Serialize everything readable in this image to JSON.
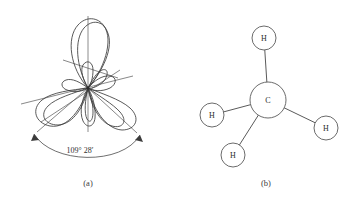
{
  "page": {
    "background_color": "#ffffff",
    "width": 356,
    "height": 202,
    "ink_color": "#4a4a4a",
    "text_color": "#2b2b2b"
  },
  "figure_a": {
    "caption": "(a)",
    "description": "sp3 hybrid orbital lobes radiating from a common center",
    "angle_label": "109° 28′",
    "angle_degrees": 109,
    "angle_minutes": 28,
    "center": {
      "x": 88,
      "y": 88
    },
    "lobes": [
      {
        "name": "lobe-up",
        "direction_deg": 90,
        "size": "large"
      },
      {
        "name": "lobe-down-left",
        "direction_deg": 215,
        "size": "large"
      },
      {
        "name": "lobe-down-right",
        "direction_deg": 325,
        "size": "large"
      },
      {
        "name": "lobe-down",
        "direction_deg": 270,
        "size": "medium"
      },
      {
        "name": "back-lobe-left",
        "direction_deg": 160,
        "size": "small"
      },
      {
        "name": "back-lobe-right",
        "direction_deg": 35,
        "size": "small"
      },
      {
        "name": "back-lobe-up-small",
        "direction_deg": 115,
        "size": "small"
      }
    ],
    "axes": [
      {
        "name": "axis-vertical",
        "angle_deg": 90
      },
      {
        "name": "axis-left-down",
        "angle_deg": 200
      },
      {
        "name": "axis-right-up",
        "angle_deg": 20
      },
      {
        "name": "axis-upper-left",
        "angle_deg": 125
      }
    ]
  },
  "figure_b": {
    "caption": "(b)",
    "description": "Methane molecule ball-and-stick model",
    "central_atom": {
      "label": "C",
      "x": 268,
      "y": 100,
      "radius": 18
    },
    "hydrogen_atoms": [
      {
        "label": "H",
        "name": "hydrogen-top",
        "x": 264,
        "y": 38,
        "radius": 12
      },
      {
        "label": "H",
        "name": "hydrogen-left",
        "x": 212,
        "y": 115,
        "radius": 12
      },
      {
        "label": "H",
        "name": "hydrogen-bottom",
        "x": 233,
        "y": 155,
        "radius": 12
      },
      {
        "label": "H",
        "name": "hydrogen-right",
        "x": 326,
        "y": 128,
        "radius": 12
      }
    ],
    "bonds": [
      {
        "name": "bond-c-h-top",
        "from": "C",
        "to": "hydrogen-top"
      },
      {
        "name": "bond-c-h-left",
        "from": "C",
        "to": "hydrogen-left"
      },
      {
        "name": "bond-c-h-bottom",
        "from": "C",
        "to": "hydrogen-bottom"
      },
      {
        "name": "bond-c-h-right",
        "from": "C",
        "to": "hydrogen-right"
      }
    ]
  }
}
